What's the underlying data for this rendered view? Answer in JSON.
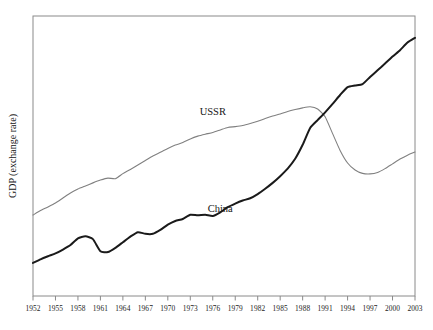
{
  "figure": {
    "background_color": "#ffffff",
    "frame_color": "#8a8a8a",
    "ylabel": "GDP (exchange rate)"
  },
  "chart_data": {
    "type": "line",
    "title": "",
    "xlabel": "",
    "ylabel": "GDP (exchange rate)",
    "grid": false,
    "legend": "inline-labels",
    "xlim": [
      1952,
      2003
    ],
    "ylim": [
      0,
      1
    ],
    "y_axis_ticks_shown": false,
    "x": [
      1952,
      1953,
      1954,
      1955,
      1956,
      1957,
      1958,
      1959,
      1960,
      1961,
      1962,
      1963,
      1964,
      1965,
      1966,
      1967,
      1968,
      1969,
      1970,
      1971,
      1972,
      1973,
      1974,
      1975,
      1976,
      1977,
      1978,
      1979,
      1980,
      1981,
      1982,
      1983,
      1984,
      1985,
      1986,
      1987,
      1988,
      1989,
      1990,
      1991,
      1992,
      1993,
      1994,
      1995,
      1996,
      1997,
      1998,
      1999,
      2000,
      2001,
      2002,
      2003
    ],
    "tick_labels": [
      "1952",
      "1955",
      "1958",
      "1961",
      "1964",
      "1967",
      "1970",
      "1973",
      "1976",
      "1979",
      "1982",
      "1985",
      "1988",
      "1991",
      "1994",
      "1997",
      "2000",
      "2003"
    ],
    "tick_values": [
      1952,
      1955,
      1958,
      1961,
      1964,
      1967,
      1970,
      1973,
      1976,
      1979,
      1982,
      1985,
      1988,
      1991,
      1994,
      1997,
      2000,
      2003
    ],
    "series": [
      {
        "name": "USSR",
        "color": "#808080",
        "line_width": 1.1,
        "label_position": {
          "x": 1976,
          "y": 0.645
        },
        "values": [
          0.289,
          0.305,
          0.318,
          0.332,
          0.35,
          0.368,
          0.382,
          0.393,
          0.404,
          0.414,
          0.421,
          0.419,
          0.437,
          0.452,
          0.468,
          0.484,
          0.5,
          0.513,
          0.527,
          0.539,
          0.548,
          0.561,
          0.571,
          0.578,
          0.584,
          0.593,
          0.602,
          0.605,
          0.609,
          0.616,
          0.624,
          0.634,
          0.643,
          0.65,
          0.659,
          0.666,
          0.672,
          0.676,
          0.668,
          0.64,
          0.58,
          0.52,
          0.475,
          0.45,
          0.438,
          0.436,
          0.441,
          0.455,
          0.472,
          0.489,
          0.503,
          0.514
        ]
      },
      {
        "name": "China",
        "color": "#1a1a1a",
        "line_width": 2.0,
        "label_position": {
          "x": 1977,
          "y": 0.3
        },
        "values": [
          0.118,
          0.131,
          0.142,
          0.152,
          0.166,
          0.182,
          0.206,
          0.213,
          0.203,
          0.16,
          0.157,
          0.172,
          0.192,
          0.212,
          0.228,
          0.222,
          0.222,
          0.236,
          0.255,
          0.268,
          0.275,
          0.29,
          0.288,
          0.29,
          0.286,
          0.299,
          0.317,
          0.33,
          0.341,
          0.349,
          0.364,
          0.383,
          0.404,
          0.428,
          0.455,
          0.49,
          0.54,
          0.6,
          0.628,
          0.656,
          0.686,
          0.718,
          0.746,
          0.752,
          0.757,
          0.782,
          0.806,
          0.83,
          0.855,
          0.878,
          0.905,
          0.922
        ]
      }
    ]
  }
}
